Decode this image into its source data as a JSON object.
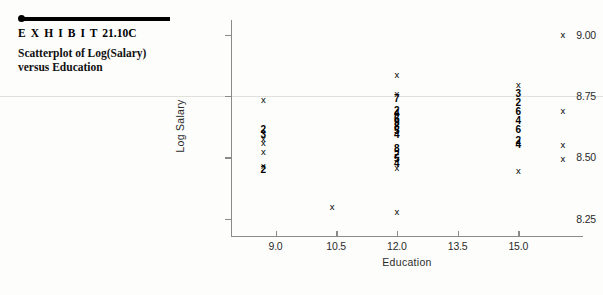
{
  "exhibit": {
    "label": "E X H I B I T",
    "number": "21.10C",
    "caption": "Scatterplot of Log(Salary) versus Education"
  },
  "chart_data": {
    "type": "scatter",
    "title": "Scatterplot of Log(Salary) versus Education",
    "xlabel": "Education",
    "ylabel": "Log Salary",
    "xlim": [
      7.9,
      16.6
    ],
    "ylim": [
      8.18,
      9.06
    ],
    "xticks": [
      "9.0",
      "10.5",
      "12.0",
      "13.5",
      "15.0"
    ],
    "xtick_values": [
      9.0,
      10.5,
      12.0,
      13.5,
      15.0
    ],
    "yticks": [
      "8.25",
      "8.50",
      "8.75",
      "9.00"
    ],
    "ytick_values": [
      8.25,
      8.5,
      8.75,
      9.0
    ],
    "grid": false,
    "legend": "none",
    "marker_note": "x = single observation; digit = number of coincident observations",
    "points": [
      {
        "x": 8.7,
        "y": 8.735,
        "marker": "x"
      },
      {
        "x": 8.7,
        "y": 8.612,
        "marker": "2"
      },
      {
        "x": 8.7,
        "y": 8.592,
        "marker": "3"
      },
      {
        "x": 8.7,
        "y": 8.575,
        "marker": "x"
      },
      {
        "x": 8.7,
        "y": 8.56,
        "marker": "x"
      },
      {
        "x": 8.7,
        "y": 8.524,
        "marker": "x"
      },
      {
        "x": 8.7,
        "y": 8.465,
        "marker": "x"
      },
      {
        "x": 8.7,
        "y": 8.447,
        "marker": "2"
      },
      {
        "x": 10.4,
        "y": 8.3,
        "marker": "x"
      },
      {
        "x": 12.0,
        "y": 8.835,
        "marker": "x"
      },
      {
        "x": 12.0,
        "y": 8.758,
        "marker": "x"
      },
      {
        "x": 12.0,
        "y": 8.737,
        "marker": "7"
      },
      {
        "x": 12.0,
        "y": 8.69,
        "marker": "2"
      },
      {
        "x": 12.0,
        "y": 8.676,
        "marker": "4"
      },
      {
        "x": 12.0,
        "y": 8.657,
        "marker": "6"
      },
      {
        "x": 12.0,
        "y": 8.64,
        "marker": "9"
      },
      {
        "x": 12.0,
        "y": 8.624,
        "marker": "8"
      },
      {
        "x": 12.0,
        "y": 8.607,
        "marker": "5"
      },
      {
        "x": 12.0,
        "y": 8.59,
        "marker": "4"
      },
      {
        "x": 12.0,
        "y": 8.534,
        "marker": "8"
      },
      {
        "x": 12.0,
        "y": 8.512,
        "marker": "2"
      },
      {
        "x": 12.0,
        "y": 8.493,
        "marker": "5"
      },
      {
        "x": 12.0,
        "y": 8.474,
        "marker": "4"
      },
      {
        "x": 12.0,
        "y": 8.456,
        "marker": "x"
      },
      {
        "x": 12.0,
        "y": 8.276,
        "marker": "x"
      },
      {
        "x": 15.0,
        "y": 8.795,
        "marker": "x"
      },
      {
        "x": 15.0,
        "y": 8.758,
        "marker": "3"
      },
      {
        "x": 15.0,
        "y": 8.722,
        "marker": "2"
      },
      {
        "x": 15.0,
        "y": 8.685,
        "marker": "6"
      },
      {
        "x": 15.0,
        "y": 8.648,
        "marker": "4"
      },
      {
        "x": 15.0,
        "y": 8.611,
        "marker": "6"
      },
      {
        "x": 15.0,
        "y": 8.567,
        "marker": "2"
      },
      {
        "x": 15.0,
        "y": 8.552,
        "marker": "4"
      },
      {
        "x": 15.0,
        "y": 8.443,
        "marker": "x"
      },
      {
        "x": 16.1,
        "y": 9.0,
        "marker": "x"
      },
      {
        "x": 16.1,
        "y": 8.69,
        "marker": "x"
      },
      {
        "x": 16.1,
        "y": 8.552,
        "marker": "x"
      },
      {
        "x": 16.1,
        "y": 8.492,
        "marker": "x"
      }
    ]
  }
}
